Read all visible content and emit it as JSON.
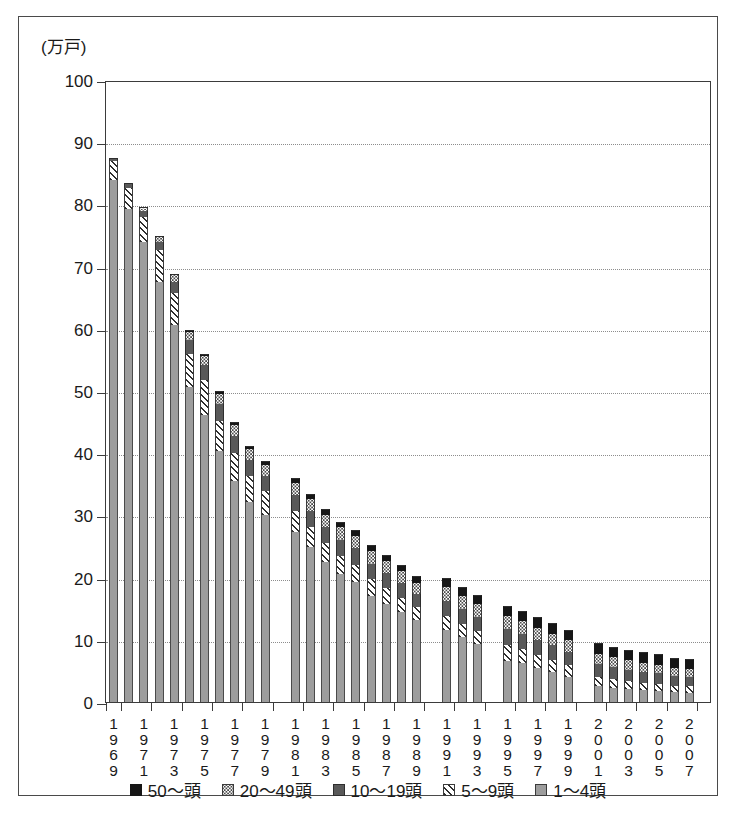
{
  "chart_data": {
    "type": "bar",
    "stacked": true,
    "title": "",
    "subtitle": "",
    "xlabel": "",
    "ylabel": "(万戸)",
    "ylim": [
      0,
      100
    ],
    "yticks": [
      0,
      10,
      20,
      30,
      40,
      50,
      60,
      70,
      80,
      90,
      100
    ],
    "grid": true,
    "legend_position": "bottom",
    "legend": [
      "50～頭",
      "20～49頭",
      "10～19頭",
      "5～9頭",
      "1～4頭"
    ],
    "tick_labels": [
      "1969",
      "1971",
      "1973",
      "1975",
      "1977",
      "1979",
      "1981",
      "1983",
      "1985",
      "1987",
      "1989",
      "1991",
      "1993",
      "1995",
      "1997",
      "1999",
      "2001",
      "2003",
      "2005",
      "2007"
    ],
    "categories": [
      "1969",
      "1970",
      "1971",
      "1972",
      "1973",
      "1974",
      "1975",
      "1976",
      "1977",
      "1978",
      "1979",
      "1981",
      "1982",
      "1983",
      "1984",
      "1985",
      "1986",
      "1987",
      "1988",
      "1989",
      "1991",
      "1992",
      "1993",
      "1995",
      "1996",
      "1997",
      "1998",
      "1999",
      "2001",
      "2002",
      "2003",
      "2004",
      "2005",
      "2006",
      "2007"
    ],
    "series": [
      {
        "name": "1～4頭",
        "values": [
          84.0,
          79.3,
          74.0,
          67.6,
          60.6,
          50.7,
          46.2,
          40.3,
          35.5,
          32.2,
          30.0,
          27.3,
          25.0,
          22.5,
          20.6,
          19.3,
          17.1,
          15.8,
          14.5,
          13.2,
          11.6,
          10.4,
          9.3,
          6.6,
          6.2,
          5.4,
          4.8,
          4.1,
          2.6,
          2.3,
          2.1,
          1.9,
          1.8,
          1.6,
          1.5
        ]
      },
      {
        "name": "5～9頭",
        "values": [
          3.0,
          3.3,
          4.0,
          5.0,
          5.2,
          5.3,
          5.5,
          4.9,
          4.6,
          4.2,
          3.9,
          3.4,
          3.1,
          3.0,
          2.9,
          2.8,
          2.6,
          2.5,
          2.3,
          2.1,
          2.3,
          2.2,
          2.1,
          2.5,
          2.3,
          2.1,
          2.0,
          1.8,
          1.5,
          1.4,
          1.3,
          1.2,
          1.1,
          1.0,
          1.0
        ]
      },
      {
        "name": "10～19頭",
        "values": [
          0.5,
          0.7,
          1.0,
          1.4,
          1.8,
          2.2,
          2.5,
          2.7,
          2.6,
          2.5,
          2.4,
          2.6,
          2.6,
          2.6,
          2.6,
          2.6,
          2.5,
          2.4,
          2.3,
          2.1,
          2.4,
          2.3,
          2.2,
          2.6,
          2.5,
          2.4,
          2.3,
          2.2,
          2.0,
          1.9,
          1.8,
          1.7,
          1.7,
          1.6,
          1.5
        ]
      },
      {
        "name": "20～49頭",
        "values": [
          0.0,
          0.2,
          0.4,
          0.7,
          1.0,
          1.3,
          1.5,
          1.7,
          1.8,
          1.8,
          1.8,
          1.9,
          1.9,
          2.0,
          2.0,
          2.0,
          2.0,
          2.0,
          1.9,
          1.8,
          2.2,
          2.1,
          2.1,
          2.1,
          2.0,
          2.0,
          1.9,
          1.8,
          1.7,
          1.6,
          1.5,
          1.5,
          1.4,
          1.3,
          1.3
        ]
      },
      {
        "name": "50～頭",
        "values": [
          0.0,
          0.0,
          0.1,
          0.1,
          0.2,
          0.3,
          0.3,
          0.4,
          0.5,
          0.5,
          0.6,
          0.8,
          0.8,
          0.9,
          0.9,
          1.0,
          1.0,
          1.0,
          1.0,
          1.0,
          1.5,
          1.5,
          1.5,
          1.7,
          1.7,
          1.7,
          1.7,
          1.7,
          1.7,
          1.7,
          1.7,
          1.7,
          1.7,
          1.6,
          1.6
        ]
      }
    ],
    "totals": [
      87.5,
      83.5,
      79.5,
      74.8,
      68.8,
      59.8,
      56.0,
      50.0,
      45.0,
      41.2,
      38.7,
      36.0,
      33.4,
      31.0,
      29.0,
      27.7,
      25.2,
      23.7,
      22.0,
      20.2,
      20.0,
      18.5,
      17.2,
      15.5,
      14.7,
      13.6,
      12.7,
      11.6,
      9.5,
      8.9,
      8.4,
      8.0,
      7.7,
      7.1,
      6.9
    ]
  },
  "legend_items": [
    {
      "label": "50～頭",
      "key": "s5"
    },
    {
      "label": "20～49頭",
      "key": "s4"
    },
    {
      "label": "10～19頭",
      "key": "s3"
    },
    {
      "label": "5～9頭",
      "key": "s2"
    },
    {
      "label": "1～4頭",
      "key": "s1"
    }
  ]
}
